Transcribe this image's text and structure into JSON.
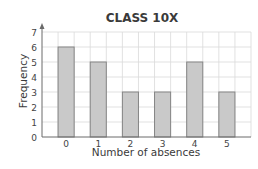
{
  "chart_data": {
    "type": "bar",
    "title": "CLASS 10X",
    "xlabel": "Number of absences",
    "ylabel": "Frequency",
    "categories": [
      "0",
      "1",
      "2",
      "3",
      "4",
      "5"
    ],
    "values": [
      6,
      5,
      3,
      3,
      5,
      3
    ],
    "ylim": [
      0,
      7
    ],
    "yticks": [
      "0",
      "1",
      "2",
      "3",
      "4",
      "5",
      "6",
      "7"
    ],
    "grid": true,
    "legend": null,
    "colors": {
      "bar_fill": "#c9c9c9",
      "bar_stroke": "#858585",
      "grid": "#d9d9d9",
      "axis": "#6a6a6a",
      "text": "#3a3a3a"
    }
  }
}
